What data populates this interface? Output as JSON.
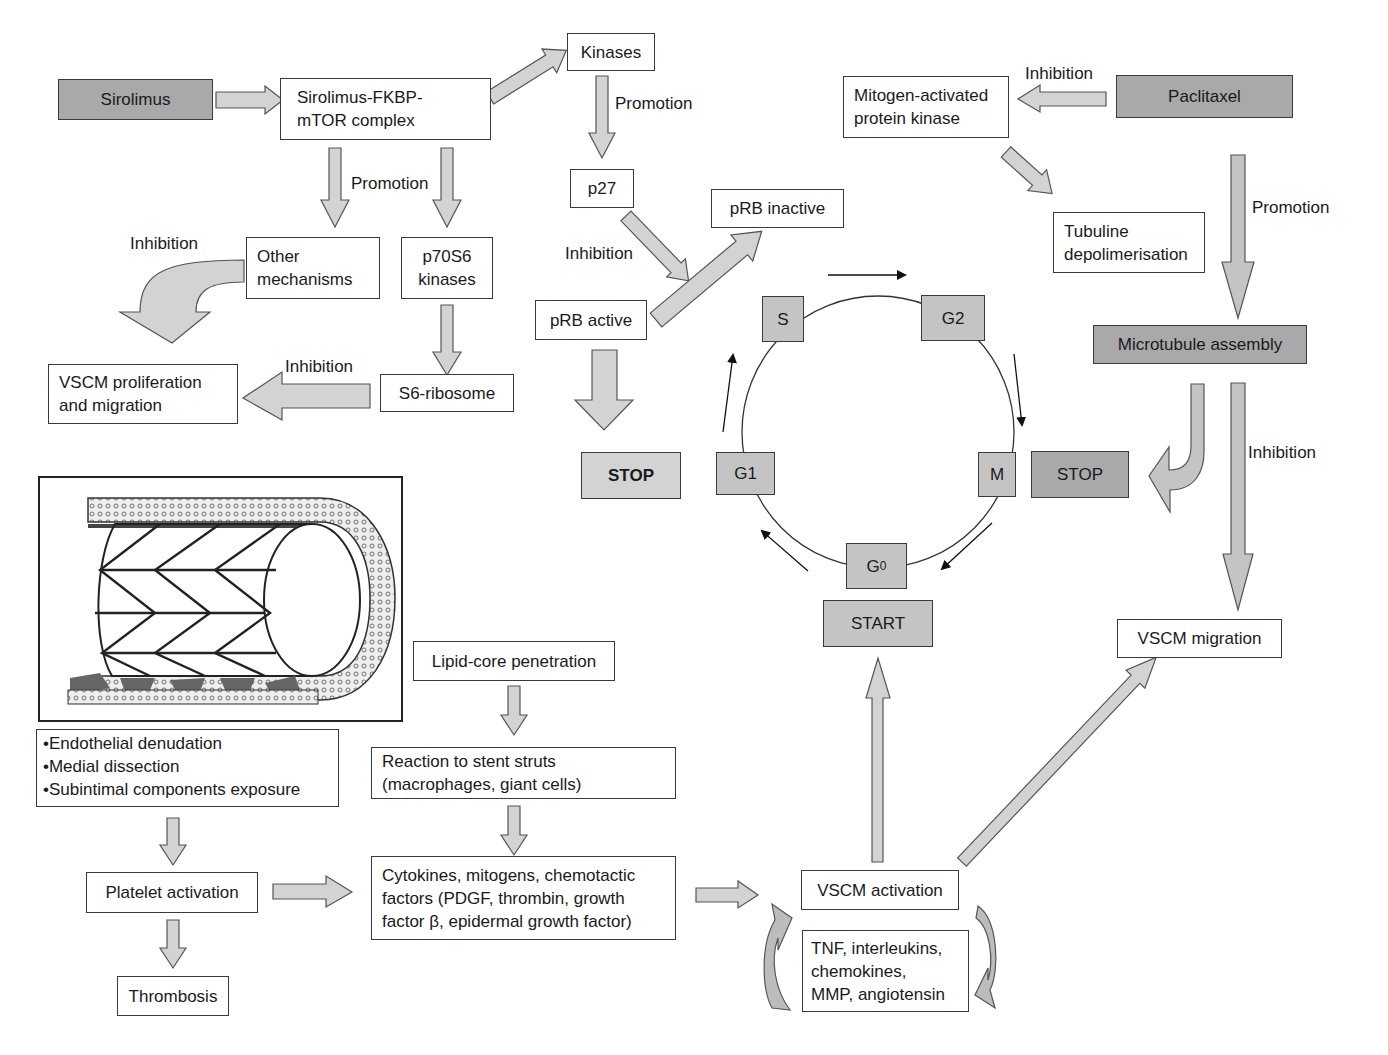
{
  "diagram": {
    "colors": {
      "arrow_fill": "#d3d3d3",
      "arrow_fill_dark": "#b8b8b8",
      "arrow_stroke": "#555555",
      "drug_box": "#a9a9a9",
      "phase_box": "#c4c4c4",
      "stop_box": "#d3d3d3",
      "box_border": "#3a3a3a"
    },
    "sirolimus_pathway": {
      "drug": "Sirolimus",
      "complex": "Sirolimus-FKBP-\nmTOR complex",
      "kinases": "Kinases",
      "promotion_kinases": "Promotion",
      "p27": "p27",
      "inhibition_p27": "Inhibition",
      "prb_inactive": "pRB inactive",
      "prb_active": "pRB active",
      "stop_left": "STOP",
      "promotion_branch": "Promotion",
      "other_mechanisms": "Other\nmechanisms",
      "p70s6_kinases": "p70S6\nkinases",
      "inhibition_other": "Inhibition",
      "s6_ribosome": "S6-ribosome",
      "inhibition_s6": "Inhibition",
      "vscm_prolif": "VSCM proliferation\nand migration"
    },
    "paclitaxel_pathway": {
      "drug": "Paclitaxel",
      "inhibition_mapk": "Inhibition",
      "mapk": "Mitogen-activated\nprotein kinase",
      "tubuline": "Tubuline\ndepolimerisation",
      "promotion_microtubule": "Promotion",
      "microtubule": "Microtubule assembly",
      "inhibition_migration": "Inhibition",
      "stop_right": "STOP",
      "vscm_migration": "VSCM migration"
    },
    "cell_cycle": {
      "phases": {
        "s": "S",
        "g2": "G2",
        "m": "M",
        "g0_base": "G",
        "g0_sub": "0",
        "g1": "G1"
      },
      "start": "START"
    },
    "stent_injury": {
      "image_alt": "stent-in-vessel illustration",
      "bullets": [
        "Endothelial denudation",
        "Medial dissection",
        "Subintimal components exposure"
      ],
      "platelet": "Platelet activation",
      "thrombosis": "Thrombosis",
      "lipid_core": "Lipid-core penetration",
      "reaction": "Reaction to stent struts\n(macrophages, giant cells)",
      "cytokines": "Cytokines, mitogens, chemotactic\nfactors (PDGF, thrombin, growth\nfactor β, epidermal growth factor)",
      "vscm_activation": "VSCM activation",
      "tnf": "TNF, interleukins,\nchemokines,\nMMP, angiotensin"
    }
  }
}
